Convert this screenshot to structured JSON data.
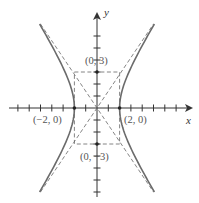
{
  "figure": {
    "type": "hyperbola",
    "equation": "x^2/4 - y^2/9 = 1",
    "axes": {
      "x_label": "x",
      "y_label": "y",
      "x_range": [
        -8,
        8
      ],
      "y_range": [
        -8,
        8
      ]
    },
    "vertices": [
      {
        "label": "(−2, 0)",
        "x": -2,
        "y": 0
      },
      {
        "label": "(2, 0)",
        "x": 2,
        "y": 0
      }
    ],
    "co_vertices": [
      {
        "label": "(0, 3)",
        "x": 0,
        "y": 3
      },
      {
        "label": "(0, −3)",
        "x": 0,
        "y": -3
      }
    ],
    "asymptotes": [
      "y = 3x/2",
      "y = -3x/2"
    ],
    "fundamental_rectangle": {
      "x": [
        -2,
        2
      ],
      "y": [
        -3,
        3
      ]
    },
    "colors": {
      "curve": "#6b6b6b",
      "axis": "#333333",
      "dashed": "#666666"
    }
  }
}
